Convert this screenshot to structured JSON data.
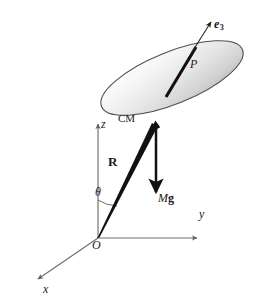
{
  "figure": {
    "background_color": "#ffffff",
    "labels": {
      "e3": {
        "base": "e",
        "subscript": "3",
        "name": "body-axis-unit-vector"
      },
      "P": {
        "text": "P",
        "name": "point-p-on-symmetry-axis"
      },
      "CM": {
        "text": "CM",
        "name": "center-of-mass"
      },
      "z": {
        "text": "z",
        "name": "z-axis"
      },
      "R": {
        "text": "R",
        "name": "position-vector"
      },
      "theta": {
        "text": "θ",
        "name": "polar-angle"
      },
      "Mg": {
        "italic": "M",
        "bold": "g",
        "name": "weight-force"
      },
      "y": {
        "text": "y",
        "name": "y-axis"
      },
      "O": {
        "text": "O",
        "name": "origin"
      },
      "x": {
        "text": "x",
        "name": "x-axis"
      }
    },
    "colors": {
      "axis_line": "#6e6e6e",
      "vector_line": "#111111",
      "disk_outline": "#4d4d4d",
      "disk_light": "#fdfdfd",
      "disk_mid": "#e6e6e6",
      "disk_dark": "#b9b9b9",
      "text": "#1a1a1a"
    },
    "geometry": {
      "origin": {
        "x": 98,
        "y": 238
      },
      "cm": {
        "x": 155,
        "y": 124
      },
      "disk_center": {
        "x": 172,
        "y": 78
      },
      "disk_radius_major": 76,
      "disk_radius_minor": 26,
      "disk_rotation_deg": -22,
      "z_axis_tip": {
        "x": 98,
        "y": 122
      },
      "y_axis_tip": {
        "x": 196,
        "y": 233
      },
      "x_axis_tip": {
        "x": 37,
        "y": 280
      },
      "e3_tip": {
        "x": 211,
        "y": 22
      },
      "mg_tip": {
        "x": 157,
        "y": 194
      },
      "theta_arc_radius": 38
    }
  }
}
